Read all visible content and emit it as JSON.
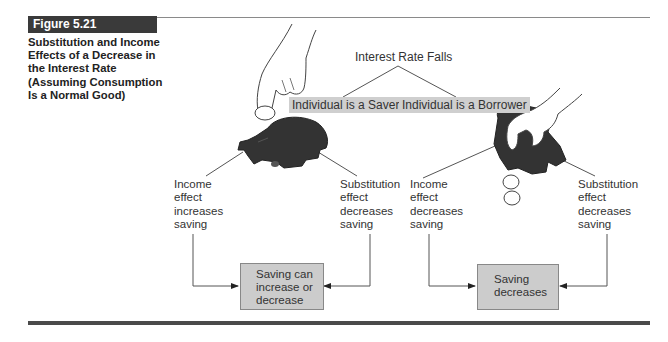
{
  "figure": {
    "label": "Figure 5.21",
    "caption": [
      "Substitution and Income",
      "Effects of a Decrease in",
      "the Interest Rate",
      "(Assuming Consumption",
      "Is a Normal Good)"
    ]
  },
  "diagram": {
    "root": "Interest Rate Falls",
    "branches": [
      {
        "label": "Individual is a Saver",
        "illustration": "hand-dropping-coin-into-piggy-bank",
        "income_effect": [
          "Income",
          "effect",
          "increases",
          "saving"
        ],
        "substitution_effect": [
          "Substitution",
          "effect",
          "decreases",
          "saving"
        ],
        "result": [
          "Saving can",
          "increase or",
          "decrease"
        ]
      },
      {
        "label": "Individual is a Borrower",
        "illustration": "hand-shaking-coins-out-of-piggy-bank",
        "income_effect": [
          "Income",
          "effect",
          "decreases",
          "saving"
        ],
        "substitution_effect": [
          "Substitution",
          "effect",
          "decreases",
          "saving"
        ],
        "result": [
          "Saving",
          "decreases"
        ]
      }
    ]
  },
  "colors": {
    "label_bg": "#3a3a3a",
    "tag_bg": "#cfcfcf",
    "box_bg": "#cccccc",
    "pig": "#333333",
    "line": "#555555"
  }
}
